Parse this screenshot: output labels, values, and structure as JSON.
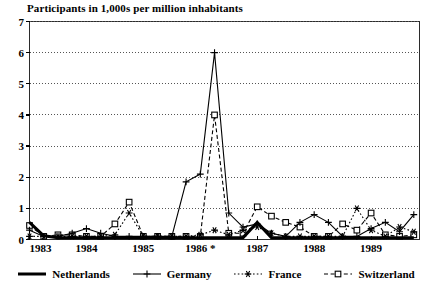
{
  "chart_data": {
    "type": "line",
    "title": "Participants in 1,000s per million inhabitants",
    "xlabel": "",
    "ylabel": "",
    "ylim": [
      0,
      7
    ],
    "yticks": [
      0,
      1,
      2,
      3,
      4,
      5,
      6,
      7
    ],
    "ytick_labels": [
      "0",
      "1",
      "2",
      "3",
      "4",
      "5",
      "6",
      "7"
    ],
    "xlim": [
      1983.0,
      1989.85
    ],
    "xticks": [
      1983,
      1984,
      1985,
      1986,
      1987,
      1988,
      1989
    ],
    "xtick_labels": [
      "1983",
      "1984",
      "1985",
      "1986 *",
      "1987",
      "1988",
      "1989"
    ],
    "grid": "horizontal-dotted",
    "legend_position": "bottom-center",
    "footnote_marker": "*",
    "series": [
      {
        "name": "Netherlands",
        "style": "thick-solid",
        "marker": "none",
        "color": "#000000",
        "x": [
          1983.0,
          1983.25,
          1983.5,
          1983.75,
          1984.0,
          1984.25,
          1984.5,
          1984.75,
          1985.0,
          1985.25,
          1985.5,
          1985.75,
          1986.0,
          1986.25,
          1986.5,
          1986.75,
          1987.0,
          1987.25,
          1987.5,
          1987.75,
          1988.0,
          1988.25,
          1988.5,
          1988.75,
          1989.0,
          1989.25,
          1989.5,
          1989.75
        ],
        "values": [
          0.55,
          0.12,
          0.06,
          0.06,
          0.06,
          0.06,
          0.06,
          0.06,
          0.06,
          0.06,
          0.06,
          0.06,
          0.06,
          0.06,
          0.06,
          0.06,
          0.55,
          0.06,
          0.06,
          0.06,
          0.06,
          0.06,
          0.06,
          0.06,
          0.06,
          0.06,
          0.06,
          0.06
        ]
      },
      {
        "name": "Germany",
        "style": "thin-solid",
        "marker": "plus",
        "color": "#000000",
        "x": [
          1983.0,
          1983.25,
          1983.5,
          1983.75,
          1984.0,
          1984.25,
          1984.5,
          1984.75,
          1985.0,
          1985.25,
          1985.5,
          1985.75,
          1986.0,
          1986.25,
          1986.5,
          1986.75,
          1987.0,
          1987.25,
          1987.5,
          1987.75,
          1988.0,
          1988.25,
          1988.5,
          1988.75,
          1989.0,
          1989.25,
          1989.5,
          1989.75
        ],
        "values": [
          0.3,
          0.1,
          0.1,
          0.2,
          0.35,
          0.2,
          0.1,
          0.1,
          0.1,
          0.1,
          0.1,
          1.85,
          2.1,
          6.0,
          0.85,
          0.4,
          0.5,
          0.2,
          0.1,
          0.55,
          0.8,
          0.55,
          0.1,
          0.1,
          0.35,
          0.55,
          0.25,
          0.8
        ]
      },
      {
        "name": "France",
        "style": "dotted",
        "marker": "asterisk",
        "color": "#000000",
        "x": [
          1983.0,
          1983.25,
          1983.5,
          1983.75,
          1984.0,
          1984.25,
          1984.5,
          1984.75,
          1985.0,
          1985.25,
          1985.5,
          1985.75,
          1986.0,
          1986.25,
          1986.5,
          1986.75,
          1987.0,
          1987.25,
          1987.5,
          1987.75,
          1988.0,
          1988.25,
          1988.5,
          1988.75,
          1989.0,
          1989.25,
          1989.5,
          1989.75
        ],
        "values": [
          0.1,
          0.1,
          0.1,
          0.1,
          0.1,
          0.1,
          0.15,
          0.85,
          0.1,
          0.1,
          0.1,
          0.1,
          0.15,
          0.3,
          0.15,
          0.3,
          0.4,
          0.2,
          0.1,
          0.1,
          0.1,
          0.1,
          0.1,
          1.0,
          0.3,
          0.1,
          0.4,
          0.25
        ]
      },
      {
        "name": "Switzerland",
        "style": "dashed",
        "marker": "square",
        "color": "#000000",
        "x": [
          1983.0,
          1983.25,
          1983.5,
          1983.75,
          1984.0,
          1984.25,
          1984.5,
          1984.75,
          1985.0,
          1985.25,
          1985.5,
          1985.75,
          1986.0,
          1986.25,
          1986.5,
          1986.75,
          1987.0,
          1987.25,
          1987.5,
          1987.75,
          1988.0,
          1988.25,
          1988.5,
          1988.75,
          1989.0,
          1989.25,
          1989.5,
          1989.75
        ],
        "values": [
          0.45,
          0.1,
          0.15,
          0.15,
          0.1,
          0.1,
          0.5,
          1.2,
          0.1,
          0.1,
          0.1,
          0.1,
          0.1,
          4.0,
          0.2,
          0.2,
          1.05,
          0.75,
          0.55,
          0.4,
          0.1,
          0.1,
          0.5,
          0.3,
          0.85,
          0.15,
          0.1,
          0.15
        ]
      }
    ]
  },
  "legend": {
    "items": [
      {
        "label": "Netherlands",
        "symbol": "thick-line"
      },
      {
        "label": "Germany",
        "symbol": "plus-line"
      },
      {
        "label": "France",
        "symbol": "asterisk-dotted"
      },
      {
        "label": "Switzerland",
        "symbol": "square-dashed"
      }
    ]
  }
}
